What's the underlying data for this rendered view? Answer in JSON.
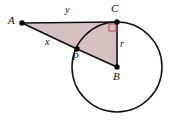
{
  "figure": {
    "type": "geometry-diagram",
    "canvas": {
      "width": 180,
      "height": 123,
      "background": "#ffffff"
    },
    "colors": {
      "stroke": "#111111",
      "triangle_fill": "#d6c0c0",
      "right_angle_marker": "#c0504d",
      "point_fill": "#000000"
    },
    "points": [
      {
        "id": "A",
        "label": "A",
        "x": 22,
        "y": 23,
        "label_x": 9,
        "label_y": 16,
        "dot": true
      },
      {
        "id": "C",
        "label": "C",
        "x": 117,
        "y": 22,
        "label_x": 112,
        "label_y": 4,
        "dot": true
      },
      {
        "id": "B",
        "label": "B",
        "x": 117,
        "y": 67,
        "label_x": 114,
        "label_y": 72,
        "dot": true
      },
      {
        "id": "P",
        "label": "P",
        "x": 77,
        "y": 49,
        "label_x": 73,
        "label_y": 51,
        "dot": true
      }
    ],
    "circle": {
      "center_id": "B",
      "cx": 117,
      "cy": 67,
      "r": 45
    },
    "triangle": {
      "vertices": "A,C,B",
      "fill": "#d6c0c0"
    },
    "segments": [
      {
        "id": "AC",
        "from": "A",
        "to": "C",
        "label": "y"
      },
      {
        "id": "AP",
        "from": "A",
        "to": "P",
        "label": "x"
      },
      {
        "id": "CB",
        "from": "C",
        "to": "B",
        "label": "r"
      },
      {
        "id": "PB",
        "from": "P",
        "to": "B",
        "label": ""
      }
    ],
    "side_labels": [
      {
        "id": "y",
        "text": "y",
        "x": 65,
        "y": 6
      },
      {
        "id": "x",
        "text": "x",
        "x": 45,
        "y": 38
      },
      {
        "id": "r",
        "text": "r",
        "x": 120,
        "y": 39
      }
    ],
    "right_angle": {
      "at": "C",
      "size": 7,
      "x": 108,
      "y": 23
    }
  }
}
